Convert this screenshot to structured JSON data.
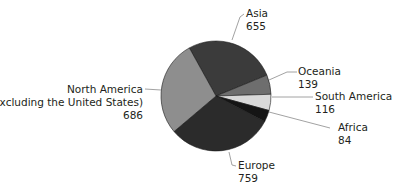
{
  "chart_data": {
    "type": "pie",
    "title": "",
    "categories": [
      "Asia",
      "Oceania",
      "South America",
      "Africa",
      "Europe",
      "North America (excluding the United States)"
    ],
    "values": [
      655,
      139,
      116,
      84,
      759,
      686
    ],
    "slices": [
      {
        "name": "Asia",
        "value": 655,
        "display_value": "655",
        "color": "#3b3b3b"
      },
      {
        "name": "Oceania",
        "value": 139,
        "display_value": "139",
        "color": "#6e6e6e"
      },
      {
        "name": "South America",
        "value": 116,
        "display_value": "116",
        "color": "#d9d9d9"
      },
      {
        "name": "Africa",
        "value": 84,
        "display_value": "84",
        "color": "#151515"
      },
      {
        "name": "Europe",
        "value": 759,
        "display_value": "759",
        "color": "#2b2b2b"
      },
      {
        "name": "North America (excluding the United States)",
        "value": 686,
        "display_value": "686",
        "color": "#8e8e8e"
      }
    ],
    "start_angle_deg": -119,
    "direction": "clockwise",
    "legend": "none (direct labels with leader lines)",
    "grid": false
  },
  "labels": {
    "asia": {
      "name": "Asia",
      "value": "655"
    },
    "oceania": {
      "name": "Oceania",
      "value": "139"
    },
    "south_america": {
      "name": "South America",
      "value": "116"
    },
    "africa": {
      "name": "Africa",
      "value": "84"
    },
    "europe": {
      "name": "Europe",
      "value": "759"
    },
    "north_america": {
      "name_line1": "North America",
      "name_line2": "(excluding the United States)",
      "value": "686"
    }
  }
}
